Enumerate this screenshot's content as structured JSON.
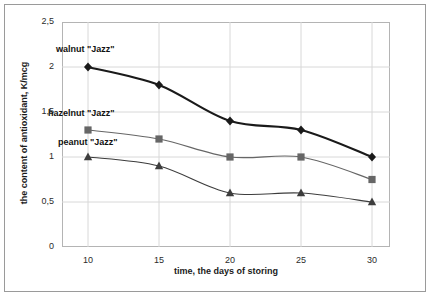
{
  "chart_data": {
    "type": "line",
    "title": "",
    "xlabel": "time, the days of storing",
    "ylabel": "the content of antioxidant, K/mcg",
    "categories": [
      10,
      15,
      20,
      25,
      30
    ],
    "xtick_labels": [
      "10",
      "15",
      "20",
      "25",
      "30"
    ],
    "ytick_labels": [
      "0",
      "0,5",
      "1",
      "1,5",
      "2",
      "2,5"
    ],
    "ytick_values": [
      0,
      0.5,
      1,
      1.5,
      2,
      2.5
    ],
    "ylim": [
      0,
      2.5
    ],
    "grid": "horizontal-and-vertical",
    "legend_position": "inline-annotations",
    "series": [
      {
        "name": "walnut \"Jazz\"",
        "marker": "diamond",
        "color": "#1a1a1a",
        "line_width": 2.2,
        "values": [
          2.0,
          1.8,
          1.4,
          1.3,
          1.0
        ]
      },
      {
        "name": "hazelnut \"Jazz\"",
        "marker": "square",
        "color": "#666666",
        "line_width": 1.2,
        "values": [
          1.3,
          1.2,
          1.0,
          1.0,
          0.75
        ]
      },
      {
        "name": "peanut \"Jazz\"",
        "marker": "triangle",
        "color": "#3d3d3d",
        "line_width": 1.2,
        "values": [
          1.0,
          0.9,
          0.6,
          0.6,
          0.5
        ]
      }
    ],
    "annotations": [
      {
        "text": "walnut \"Jazz\"",
        "x": 56,
        "y": 44
      },
      {
        "text": "hazelnut \"Jazz\"",
        "x": 48,
        "y": 108
      },
      {
        "text": "peanut \"Jazz\"",
        "x": 58,
        "y": 137
      }
    ]
  }
}
